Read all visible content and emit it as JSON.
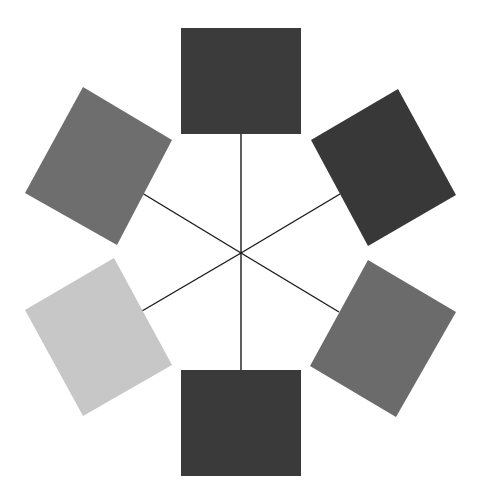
{
  "diagram": {
    "type": "hub-and-spoke",
    "center": [
      241,
      253
    ],
    "line_color": "#1a1a1a",
    "nodes": [
      {
        "id": "top",
        "color": "#3b3b3b",
        "points": "181,28 301,28 301,134 181,134",
        "spoke_end": [
          241,
          134
        ]
      },
      {
        "id": "upper-right",
        "color": "#383838",
        "points": "398,89 456,195 368,246 311,140",
        "spoke_end": [
          340,
          194
        ]
      },
      {
        "id": "lower-right",
        "color": "#6b6b6b",
        "points": "368,260 456,312 396,417 310,366",
        "spoke_end": [
          339,
          312
        ]
      },
      {
        "id": "bottom",
        "color": "#3a3a3a",
        "points": "181,370 301,370 301,476 181,476",
        "spoke_end": [
          241,
          370
        ]
      },
      {
        "id": "lower-left",
        "color": "#c7c7c7",
        "points": "114,258 172,365 83,416 25,310",
        "spoke_end": [
          142,
          311
        ]
      },
      {
        "id": "upper-left",
        "color": "#6e6e6e",
        "points": "83,87 172,140 117,245 25,193",
        "spoke_end": [
          142,
          193
        ]
      }
    ]
  }
}
